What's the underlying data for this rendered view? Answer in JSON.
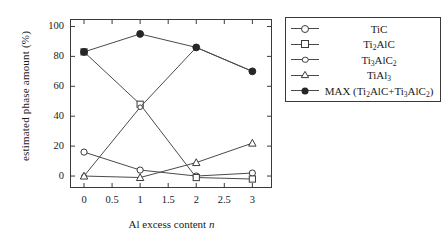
{
  "chart_data": {
    "type": "line",
    "title": "",
    "xlabel": "Al excess content n",
    "ylabel": "estimated phase amount (%)",
    "xlim": [
      -0.25,
      3.35
    ],
    "ylim": [
      -8,
      105
    ],
    "grid": false,
    "legend_position": "right-outside",
    "x": [
      0,
      1,
      2,
      3
    ],
    "xticks": [
      "0",
      "0.5",
      "1",
      "1.5",
      "2",
      "2.5",
      "3"
    ],
    "xtick_values": [
      0,
      0.5,
      1,
      1.5,
      2,
      2.5,
      3
    ],
    "yticks": [
      "0",
      "20",
      "40",
      "60",
      "80",
      "100"
    ],
    "ytick_values": [
      0,
      20,
      40,
      60,
      80,
      100
    ],
    "series": [
      {
        "name": "TiC",
        "marker": "open-circle",
        "values": [
          16,
          4,
          0,
          2
        ]
      },
      {
        "name": "Ti2AlC",
        "marker": "open-square",
        "values": [
          83,
          48,
          -1,
          -2
        ]
      },
      {
        "name": "Ti3AlC2",
        "marker": "open-diamond",
        "values": [
          0,
          46,
          86,
          70
        ]
      },
      {
        "name": "TiAl3",
        "marker": "open-triangle",
        "values": [
          0,
          -1,
          9,
          22
        ]
      },
      {
        "name": "MAX (Ti2AlC+Ti3AlC2)",
        "marker": "filled-circle",
        "values": [
          83,
          95,
          86,
          70
        ]
      }
    ]
  },
  "axes": {
    "ylabel": "estimated phase amount (%)",
    "xlabel_pre": "Al excess content ",
    "xlabel_italic": "n",
    "yticks": [
      "100",
      "80",
      "60",
      "40",
      "20",
      "0"
    ],
    "xticks": [
      "0",
      "0.5",
      "1",
      "1.5",
      "2",
      "2.5",
      "3"
    ]
  },
  "legend": {
    "entries": [
      {
        "id": "tic",
        "marker": "open-circle",
        "label_main": "TiC",
        "parts": [
          {
            "t": "TiC",
            "sub": false
          }
        ]
      },
      {
        "id": "ti2alc",
        "marker": "open-square",
        "label_main": "Ti2AlC",
        "parts": [
          {
            "t": "Ti",
            "sub": false
          },
          {
            "t": "2",
            "sub": true
          },
          {
            "t": "AlC",
            "sub": false
          }
        ]
      },
      {
        "id": "ti3alc2",
        "marker": "open-diamond",
        "label_main": "Ti3AlC2",
        "parts": [
          {
            "t": "Ti",
            "sub": false
          },
          {
            "t": "3",
            "sub": true
          },
          {
            "t": "AlC",
            "sub": false
          },
          {
            "t": "2",
            "sub": true
          }
        ]
      },
      {
        "id": "tial3",
        "marker": "open-triangle",
        "label_main": "TiAl3",
        "parts": [
          {
            "t": "TiAl",
            "sub": false
          },
          {
            "t": "3",
            "sub": true
          }
        ]
      },
      {
        "id": "max",
        "marker": "filled-circle",
        "label_main": "MAX (Ti2AlC+Ti3AlC2)",
        "parts": [
          {
            "t": "MAX (Ti",
            "sub": false
          },
          {
            "t": "2",
            "sub": true
          },
          {
            "t": "AlC+Ti",
            "sub": false
          },
          {
            "t": "3",
            "sub": true
          },
          {
            "t": "AlC",
            "sub": false
          },
          {
            "t": "2",
            "sub": true
          },
          {
            "t": ")",
            "sub": false
          }
        ]
      }
    ]
  },
  "colors": {
    "line": "#4a4a4a",
    "marker_edge": "#3a3a3a",
    "marker_fill_open": "#ffffff",
    "marker_fill_solid": "#262626",
    "frame": "#3a3a3a",
    "text": "#1a1a1a",
    "background": "#ffffff"
  }
}
